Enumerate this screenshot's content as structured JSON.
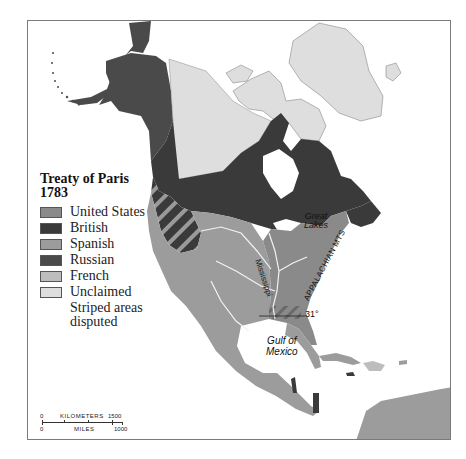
{
  "legend": {
    "title_line1": "Treaty of Paris",
    "title_line2": "1783",
    "items": [
      {
        "label": "United States",
        "color": "#8a8a8a"
      },
      {
        "label": "British",
        "color": "#3a3a3a"
      },
      {
        "label": "Spanish",
        "color": "#9c9c9c"
      },
      {
        "label": "Russian",
        "color": "#4a4a4a"
      },
      {
        "label": "French",
        "color": "#bdbdbd"
      },
      {
        "label": "Unclaimed",
        "color": "#dedede"
      }
    ],
    "note_line1": "Striped areas",
    "note_line2": "disputed"
  },
  "labels": {
    "great_lakes_1": "Great",
    "great_lakes_2": "Lakes",
    "mississippi": "Mississippi",
    "appalachian": "APPALACHIAN MTS",
    "parallel": "31°",
    "gulf_1": "Gulf of",
    "gulf_2": "Mexico"
  },
  "scale": {
    "km_start": "0",
    "km_label": "KILOMETERS",
    "km_end": "1500",
    "mi_start": "0",
    "mi_label": "MILES",
    "mi_end": "1000"
  },
  "colors": {
    "united_states": "#8a8a8a",
    "british": "#3a3a3a",
    "spanish": "#9c9c9c",
    "russian": "#4a4a4a",
    "french": "#bdbdbd",
    "unclaimed": "#dedede",
    "water": "#ffffff",
    "river": "#f2f2f2"
  }
}
